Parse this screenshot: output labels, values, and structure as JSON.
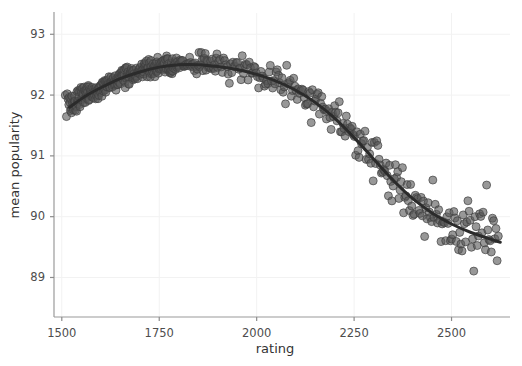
{
  "chart_data": {
    "type": "scatter",
    "title": "",
    "xlabel": "rating",
    "ylabel": "mean popularity",
    "xlim": [
      1480,
      2650
    ],
    "ylim": [
      88.35,
      93.35
    ],
    "xticks": [
      1500,
      1750,
      2000,
      2250,
      2500
    ],
    "xticklabels": [
      "1500",
      "1750",
      "2000",
      "2250",
      "2500"
    ],
    "yticks": [
      89,
      90,
      91,
      92,
      93
    ],
    "yticklabels": [
      "89",
      "90",
      "91",
      "92",
      "93"
    ],
    "grid": true,
    "legend": "none",
    "marker": {
      "shape": "circle",
      "size_px": 8,
      "fill": "#595959",
      "edge": "#3d3d3d",
      "opacity": 0.62
    },
    "trend": {
      "name": "smoothed fit",
      "color": "#2b2b2b",
      "width_px": 3,
      "x": [
        1520,
        1560,
        1600,
        1650,
        1700,
        1750,
        1800,
        1850,
        1900,
        1950,
        2000,
        2050,
        2100,
        2150,
        2200,
        2250,
        2300,
        2350,
        2400,
        2450,
        2500,
        2550,
        2600,
        2625
      ],
      "y": [
        91.8,
        91.98,
        92.12,
        92.27,
        92.38,
        92.46,
        92.5,
        92.5,
        92.47,
        92.42,
        92.34,
        92.23,
        92.08,
        91.88,
        91.62,
        91.3,
        90.95,
        90.6,
        90.3,
        90.06,
        89.88,
        89.74,
        89.63,
        89.58
      ]
    },
    "series": [
      {
        "name": "games",
        "n_points": 742,
        "x": [
          1509,
          1512,
          1514,
          1516,
          1518,
          1519,
          1521,
          1522,
          1523,
          1524,
          1525,
          1526,
          1527,
          1528,
          1529,
          1530,
          1531,
          1532,
          1533,
          1534,
          1535,
          1536,
          1537,
          1538,
          1539,
          1540,
          1541,
          1542,
          1543,
          1544,
          1545,
          1546,
          1547,
          1548,
          1549,
          1550,
          1551,
          1552,
          1553,
          1554,
          1555,
          1556,
          1557,
          1558,
          1559,
          1560,
          1561,
          1562,
          1563,
          1564,
          1565,
          1566,
          1567,
          1568,
          1569,
          1570,
          1571,
          1572,
          1573,
          1574,
          1575,
          1576,
          1577,
          1578,
          1579,
          1580,
          1581,
          1582,
          1583,
          1584,
          1585,
          1586,
          1587,
          1588,
          1589,
          1590,
          1591,
          1592,
          1593,
          1594,
          1595,
          1596,
          1597,
          1598,
          1599,
          1600,
          1601,
          1602,
          1603,
          1604,
          1605,
          1606,
          1607,
          1608,
          1609,
          1610,
          1611,
          1612,
          1613,
          1614,
          1615,
          1616,
          1617,
          1618,
          1619,
          1620,
          1621,
          1622,
          1623,
          1624,
          1625,
          1626,
          1627,
          1628,
          1629,
          1630,
          1631,
          1632,
          1633,
          1634,
          1635,
          1636,
          1637,
          1638,
          1639,
          1640,
          1641,
          1642,
          1643,
          1644,
          1645,
          1646,
          1647,
          1648,
          1649,
          1650,
          1651,
          1652,
          1653,
          1654,
          1655,
          1656,
          1657,
          1658,
          1659,
          1660,
          1661,
          1662,
          1663,
          1664,
          1665,
          1666,
          1667,
          1668,
          1669,
          1670,
          1671,
          1672,
          1673,
          1674,
          1675,
          1676,
          1677,
          1678,
          1679,
          1680,
          1681,
          1682,
          1683,
          1684,
          1685,
          1686,
          1687,
          1688,
          1689,
          1690,
          1691,
          1692,
          1693,
          1694,
          1695,
          1696,
          1697,
          1698,
          1699,
          1700,
          1701,
          1702,
          1703,
          1704,
          1705,
          1706,
          1707,
          1708,
          1709,
          1710,
          1711,
          1712,
          1713,
          1714,
          1715,
          1716,
          1717,
          1718,
          1719,
          1720,
          1721,
          1722,
          1723,
          1724,
          1725,
          1726,
          1727,
          1728,
          1729,
          1730,
          1731,
          1732,
          1733,
          1734,
          1735,
          1736,
          1737,
          1738,
          1739,
          1740,
          1741,
          1742,
          1743,
          1744,
          1745,
          1746,
          1747,
          1748,
          1749,
          1750,
          1751,
          1752,
          1753,
          1754,
          1755,
          1756,
          1757,
          1758,
          1759,
          1760,
          1761,
          1762,
          1763,
          1764,
          1765,
          1766,
          1767,
          1768,
          1769,
          1770,
          1771,
          1772,
          1773,
          1774,
          1775,
          1776,
          1777,
          1778,
          1779,
          1780,
          1781,
          1782,
          1783,
          1784,
          1785,
          1786,
          1787,
          1788,
          1789,
          1790,
          1791,
          1792,
          1793,
          1794,
          1795,
          1796,
          1797,
          1798,
          1799,
          1800,
          1802,
          1804,
          1806,
          1808,
          1810,
          1812,
          1814,
          1816,
          1818,
          1820,
          1822,
          1824,
          1826,
          1828,
          1830,
          1832,
          1834,
          1836,
          1838,
          1840,
          1842,
          1844,
          1846,
          1848,
          1850,
          1852,
          1854,
          1856,
          1858,
          1860,
          1862,
          1864,
          1866,
          1868,
          1870,
          1872,
          1874,
          1876,
          1878,
          1880,
          1882,
          1884,
          1886,
          1888,
          1890,
          1892,
          1894,
          1896,
          1898,
          1900,
          1903,
          1906,
          1909,
          1912,
          1915,
          1918,
          1921,
          1924,
          1927,
          1930,
          1933,
          1936,
          1939,
          1942,
          1945,
          1948,
          1951,
          1954,
          1957,
          1960,
          1963,
          1966,
          1969,
          1972,
          1975,
          1978,
          1981,
          1984,
          1987,
          1990,
          1993,
          1996,
          1999,
          2002,
          2005,
          2008,
          2011,
          2014,
          2017,
          2020,
          2023,
          2026,
          2029,
          2032,
          2035,
          2038,
          2041,
          2044,
          2047,
          2050,
          2053,
          2056,
          2059,
          2062,
          2065,
          2068,
          2071,
          2074,
          2077,
          2080,
          2083,
          2086,
          2089,
          2092,
          2095,
          2098,
          2101,
          2104,
          2107,
          2110,
          2113,
          2116,
          2119,
          2122,
          2125,
          2128,
          2131,
          2134,
          2137,
          2140,
          2143,
          2146,
          2149,
          2152,
          2155,
          2158,
          2161,
          2164,
          2167,
          2170,
          2173,
          2176,
          2179,
          2182,
          2185,
          2188,
          2191,
          2194,
          2197,
          2200,
          2203,
          2206,
          2209,
          2212,
          2215,
          2218,
          2221,
          2224,
          2227,
          2230,
          2233,
          2236,
          2239,
          2242,
          2245,
          2248,
          2251,
          2254,
          2257,
          2260,
          2263,
          2266,
          2269,
          2272,
          2275,
          2278,
          2281,
          2284,
          2287,
          2290,
          2293,
          2296,
          2299,
          2302,
          2305,
          2308,
          2311,
          2314,
          2317,
          2320,
          2323,
          2326,
          2329,
          2332,
          2335,
          2338,
          2341,
          2344,
          2347,
          2350,
          2353,
          2356,
          2359,
          2362,
          2365,
          2368,
          2371,
          2374,
          2377,
          2380,
          2383,
          2386,
          2389,
          2392,
          2395,
          2398,
          2401,
          2404,
          2407,
          2410,
          2413,
          2416,
          2419,
          2422,
          2425,
          2428,
          2431,
          2434,
          2437,
          2440,
          2443,
          2446,
          2449,
          2452,
          2455,
          2458,
          2461,
          2464,
          2467,
          2470,
          2473,
          2476,
          2479,
          2482,
          2485,
          2488,
          2491,
          2494,
          2497,
          2500,
          2503,
          2506,
          2509,
          2512,
          2515,
          2518,
          2521,
          2524,
          2527,
          2530,
          2533,
          2536,
          2539,
          2542,
          2545,
          2548,
          2551,
          2554,
          2557,
          2560,
          2563,
          2566,
          2569,
          2572,
          2575,
          2578,
          2581,
          2584,
          2587,
          2590,
          2593,
          2596,
          2599,
          2602,
          2605,
          2608,
          2611,
          2614,
          2617,
          2620
        ],
        "note": "y values are drawn from the trend with scatter noise; see y array"
      }
    ]
  },
  "figure": {
    "background": "#ffffff",
    "grid_color": "#f2f2f2",
    "axis_color": "#9a9a9a",
    "tick_color": "#8c8c8c",
    "text_color": "#4d4d4d"
  }
}
